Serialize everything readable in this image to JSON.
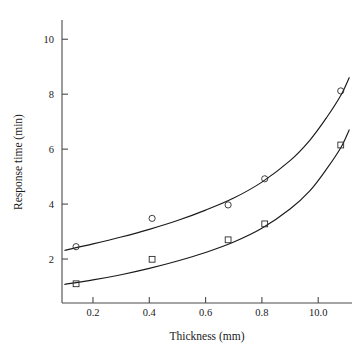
{
  "chart_data": {
    "type": "scatter",
    "title": "",
    "xlabel": "Thickness (mm)",
    "ylabel": "Response time (min)",
    "grid": false,
    "legend": "none",
    "xlim": [
      0.09,
      1.12
    ],
    "ylim": [
      0.4,
      10.7
    ],
    "xticks": [
      0.2,
      0.4,
      0.6,
      0.8,
      1.0
    ],
    "xticklabels": [
      "0.2",
      "0.4",
      "0.6",
      "0.8",
      "10.0"
    ],
    "yticks": [
      2,
      4,
      6,
      8,
      10
    ],
    "yticklabels": [
      "2",
      "4",
      "6",
      "8",
      "10"
    ],
    "series": [
      {
        "name": "upper-curve",
        "marker": "circle",
        "x": [
          0.14,
          0.41,
          0.68,
          0.81,
          1.08
        ],
        "y": [
          2.45,
          3.48,
          3.97,
          4.92,
          8.12
        ],
        "fit_x": [
          0.1,
          0.2,
          0.3,
          0.4,
          0.5,
          0.6,
          0.7,
          0.8,
          0.9,
          0.97,
          1.03,
          1.08,
          1.11
        ],
        "fit_y": [
          2.32,
          2.55,
          2.8,
          3.08,
          3.4,
          3.78,
          4.22,
          4.8,
          5.58,
          6.32,
          7.15,
          7.95,
          8.6
        ]
      },
      {
        "name": "lower-curve",
        "marker": "square",
        "x": [
          0.14,
          0.41,
          0.68,
          0.81,
          1.08
        ],
        "y": [
          1.1,
          1.99,
          2.7,
          3.28,
          6.15
        ],
        "fit_x": [
          0.1,
          0.2,
          0.3,
          0.4,
          0.5,
          0.6,
          0.7,
          0.8,
          0.9,
          0.97,
          1.03,
          1.08,
          1.11
        ],
        "fit_y": [
          1.08,
          1.24,
          1.43,
          1.66,
          1.93,
          2.24,
          2.62,
          3.12,
          3.82,
          4.48,
          5.28,
          6.05,
          6.7
        ]
      }
    ]
  },
  "axes": {
    "x_title": "Thickness (mm)",
    "y_title": "Response time (min)"
  }
}
